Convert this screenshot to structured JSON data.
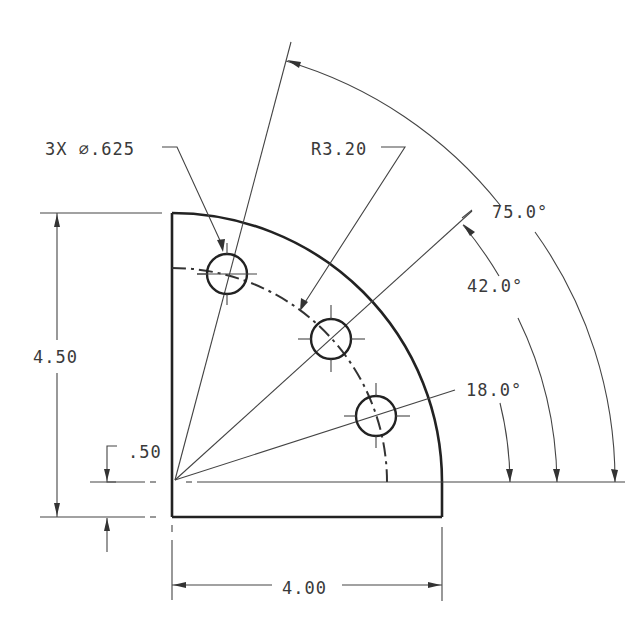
{
  "drawing": {
    "type": "engineering-drawing",
    "subject": "quarter-round plate with three holes on bolt circle",
    "callouts": {
      "holes": "3X ⌀.625",
      "radius": "R3.20",
      "height": "4.50",
      "width": "4.00",
      "offset": ".50",
      "angle_1": "75.0°",
      "angle_2": "42.0°",
      "angle_3": "18.0°"
    },
    "holes": [
      {
        "angle_deg": 75.0,
        "diameter": ".625"
      },
      {
        "angle_deg": 42.0,
        "diameter": ".625"
      },
      {
        "angle_deg": 18.0,
        "diameter": ".625"
      }
    ],
    "colors": {
      "line": "#222222",
      "text": "#3a3a3a",
      "background": "#ffffff"
    }
  }
}
